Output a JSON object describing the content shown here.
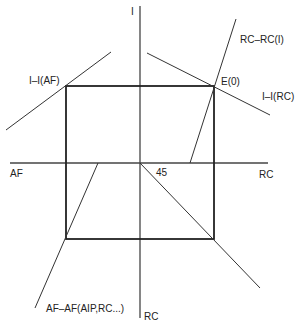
{
  "diagram": {
    "axes": {
      "vertical_top_label": "I",
      "vertical_bottom_label": "RC",
      "horizontal_left_label": "AF",
      "horizontal_right_label": "RC"
    },
    "curves": {
      "i_af": "I–I(AF)",
      "rc_rc_i": "RC–RC(I)",
      "i_rc": "I–I(RC)",
      "af_af": "AF–AF(AIP,RC...)"
    },
    "equilibrium_label": "E(0)",
    "angle_label": "45",
    "colors": {
      "line": "#222222",
      "axis": "#444444"
    }
  }
}
